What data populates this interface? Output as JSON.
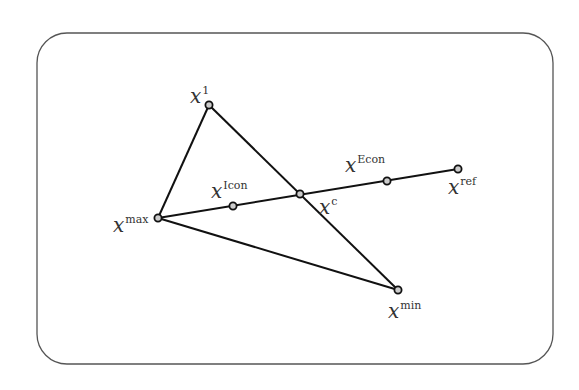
{
  "diagram": {
    "type": "geometric-construction",
    "frame": {
      "x": 37,
      "y": 33,
      "width": 516,
      "height": 331,
      "radius": 30,
      "stroke": "#555555"
    },
    "points": [
      {
        "id": "x1",
        "base": "x",
        "sup": "1",
        "x": 209,
        "y": 105,
        "label_x": 190,
        "label_y": 103
      },
      {
        "id": "xmax",
        "base": "x",
        "sup": "max",
        "x": 158,
        "y": 218,
        "label_x": 113,
        "label_y": 232
      },
      {
        "id": "xmin",
        "base": "x",
        "sup": "min",
        "x": 398,
        "y": 290,
        "label_x": 388,
        "label_y": 318
      },
      {
        "id": "xc",
        "base": "x",
        "sup": "c",
        "x": 300,
        "y": 194,
        "label_x": 319,
        "label_y": 214
      },
      {
        "id": "xIcon",
        "base": "x",
        "sup": "Icon",
        "x": 233,
        "y": 206,
        "label_x": 211,
        "label_y": 198
      },
      {
        "id": "xEcon",
        "base": "x",
        "sup": "Econ",
        "x": 387,
        "y": 181,
        "label_x": 345,
        "label_y": 172
      },
      {
        "id": "xref",
        "base": "x",
        "sup": "ref",
        "x": 458,
        "y": 169,
        "label_x": 448,
        "label_y": 194
      }
    ],
    "segments": [
      {
        "from": "xmax",
        "to": "x1"
      },
      {
        "from": "x1",
        "to": "xmin"
      },
      {
        "from": "xmax",
        "to": "xmin"
      },
      {
        "from": "xmax",
        "to": "xref"
      }
    ],
    "line_color": "#111111",
    "point_fill": "#cccccc"
  }
}
